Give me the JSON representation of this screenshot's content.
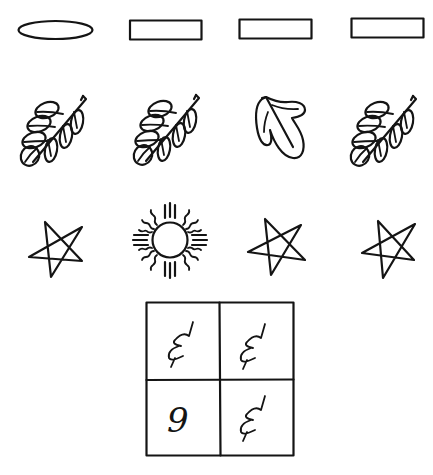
{
  "figure": {
    "ink_color": "#141414",
    "background": "#ffffff"
  },
  "rows": [
    {
      "name": "shapes",
      "items": [
        {
          "shape": "ellipse",
          "odd": true
        },
        {
          "shape": "rectangle",
          "odd": false
        },
        {
          "shape": "rectangle",
          "odd": false
        },
        {
          "shape": "rectangle",
          "odd": false
        }
      ]
    },
    {
      "name": "leaves",
      "items": [
        {
          "shape": "leafy-branch-icon",
          "odd": false
        },
        {
          "shape": "leafy-branch-icon",
          "odd": false
        },
        {
          "shape": "single-leaf-icon",
          "odd": true
        },
        {
          "shape": "leafy-branch-icon",
          "odd": false
        }
      ]
    },
    {
      "name": "stars",
      "items": [
        {
          "shape": "pentagram-star-icon",
          "odd": false
        },
        {
          "shape": "sun-icon",
          "odd": true
        },
        {
          "shape": "pentagram-star-icon",
          "odd": false
        },
        {
          "shape": "pentagram-star-icon",
          "odd": false
        }
      ]
    }
  ],
  "grid": {
    "rows": 2,
    "cols": 2,
    "cells": [
      {
        "glyph": "squiggle",
        "text": ""
      },
      {
        "glyph": "squiggle",
        "text": ""
      },
      {
        "glyph": "digit",
        "text": "9"
      },
      {
        "glyph": "squiggle",
        "text": ""
      }
    ]
  }
}
